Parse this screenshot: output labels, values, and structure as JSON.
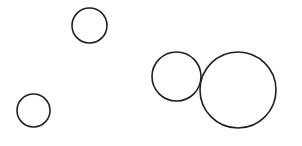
{
  "figure": {
    "background_color": "#ffffff",
    "stroke_color": "#231f20",
    "fill_color": "#ffffff",
    "stroke_width": 1.6,
    "width": 302,
    "height": 146
  },
  "chart_data": {
    "type": "scatter",
    "title": "",
    "subtitle": "",
    "xlabel": "",
    "ylabel": "",
    "xlim": [
      0,
      302
    ],
    "ylim": [
      0,
      146
    ],
    "grid": false,
    "legend": null,
    "axes_visible": false,
    "tick_labels_x": [],
    "tick_labels_y": [],
    "marker_style": "open-circle",
    "series": [
      {
        "name": "circles",
        "points": [
          {
            "id": "circle-top-left",
            "label": "",
            "x": 89.5,
            "y": 25.5,
            "r": 17.5
          },
          {
            "id": "circle-bottom-left",
            "label": "",
            "x": 33.5,
            "y": 110.5,
            "r": 16.5
          },
          {
            "id": "circle-middle",
            "label": "",
            "x": 176.5,
            "y": 76.5,
            "r": 24.5
          },
          {
            "id": "circle-large-right",
            "label": "",
            "x": 238.0,
            "y": 90.0,
            "r": 38.0
          }
        ]
      }
    ],
    "annotations": []
  }
}
